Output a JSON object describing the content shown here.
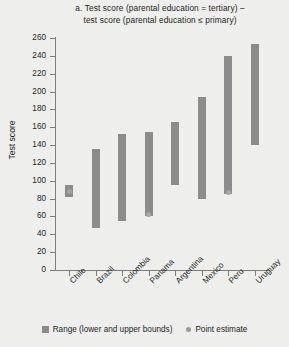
{
  "figure": {
    "panel_label": "a.",
    "title_line1": "Test score (parental education = tertiary) –",
    "title_line2": "test score (parental education ≤ primary)",
    "y_axis_title": "Test score",
    "bar_color": "#8c8c8c",
    "point_color": "#a6a6a6",
    "background_color": "#eeeeed"
  },
  "legend": {
    "position": "bottom-center",
    "items": [
      {
        "label": "Range (lower and upper bounds)",
        "marker": "square-swatch",
        "color": "#8c8c8c"
      },
      {
        "label": "Point estimate",
        "marker": "dot-swatch",
        "color": "#9c9c9c"
      }
    ]
  },
  "chart_data": {
    "type": "bar",
    "subtype": "floating-range-bar",
    "title": "a. Test score (parental education = tertiary) – test score (parental education ≤ primary)",
    "xlabel": "",
    "ylabel": "Test score",
    "ylim": [
      0,
      260
    ],
    "ytick_step": 20,
    "yticks": [
      0,
      20,
      40,
      60,
      80,
      100,
      120,
      140,
      160,
      180,
      200,
      220,
      240,
      260
    ],
    "ytick_labels": [
      "0",
      "20",
      "40",
      "60",
      "80",
      "100",
      "120",
      "140",
      "160",
      "180",
      "200",
      "220",
      "240",
      "260"
    ],
    "grid": false,
    "categories": [
      "Chile",
      "Brazil",
      "Colombia",
      "Panama",
      "Argentina",
      "Mexico",
      "Peru",
      "Uruguay"
    ],
    "series": [
      {
        "name": "Range (lower and upper bounds)",
        "lower": [
          82,
          47,
          55,
          60,
          95,
          80,
          85,
          140
        ],
        "upper": [
          95,
          136,
          152,
          155,
          166,
          194,
          240,
          253
        ]
      },
      {
        "name": "Point estimate",
        "values": [
          88,
          null,
          null,
          62,
          null,
          null,
          87,
          null
        ]
      }
    ]
  }
}
